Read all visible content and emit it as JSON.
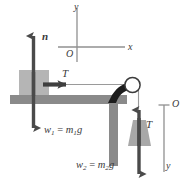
{
  "figure": {
    "type": "physics-free-body-diagram",
    "background_color": "#ffffff",
    "colors": {
      "table": "#8a8a8a",
      "block": "#b5b5b5",
      "hanging_mass": "#a8a8a8",
      "arrow": "#4a4a4a",
      "bracket": "#1c1c1c",
      "axis": "#909090",
      "pulley_outline": "#3c3c3c",
      "pulley_fill": "#ffffff",
      "string": "#9a9a9a",
      "text": "#3a3a3a"
    }
  },
  "coordinate_axes": {
    "name": "table-coordinate-axes",
    "origin_label": "O",
    "x_label": "x",
    "y_label": "y"
  },
  "vertical_axis": {
    "name": "hanging-mass-axis",
    "origin_label": "O",
    "down_label": "y",
    "tick": true
  },
  "forces": {
    "normal": {
      "label": "n",
      "direction": "up",
      "on": "block"
    },
    "tension_block": {
      "label": "T",
      "direction": "right",
      "on": "block"
    },
    "weight_block": {
      "label": "w",
      "subscript": "1",
      "equals": " = ",
      "expression_mass": "m",
      "expression_mass_sub": "1",
      "expression_g": "g",
      "direction": "down",
      "on": "block"
    },
    "tension_hanging": {
      "label": "T",
      "direction": "up",
      "on": "hanging-mass"
    },
    "weight_hanging": {
      "label": "w",
      "subscript": "2",
      "equals": " = ",
      "expression_mass": "m",
      "expression_mass_sub": "2",
      "expression_g": "g",
      "direction": "down",
      "on": "hanging-mass"
    }
  },
  "objects": {
    "table": {
      "name": "table"
    },
    "block": {
      "name": "block-m1"
    },
    "pulley": {
      "name": "pulley"
    },
    "hanging_mass": {
      "name": "hanging-mass-m2"
    },
    "string": {
      "name": "string"
    }
  }
}
